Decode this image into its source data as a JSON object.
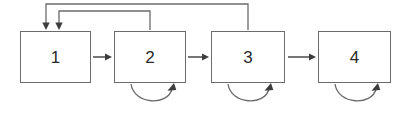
{
  "diagram": {
    "canvas": {
      "width": 410,
      "height": 115,
      "background": "#ffffff"
    },
    "style": {
      "stroke_color": "#6b6b6b",
      "arrow_color": "#3d3d3d",
      "text_color": "#2a2a2a",
      "box_fill": "#ffffff",
      "stroke_width": 1
    },
    "nodes": [
      {
        "id": "node-1",
        "label": "1",
        "x": 20,
        "y": 31,
        "width": 71,
        "height": 52
      },
      {
        "id": "node-2",
        "label": "2",
        "x": 114,
        "y": 31,
        "width": 72,
        "height": 52
      },
      {
        "id": "node-3",
        "label": "3",
        "x": 211,
        "y": 31,
        "width": 74,
        "height": 52
      },
      {
        "id": "node-4",
        "label": "4",
        "x": 318,
        "y": 31,
        "width": 73,
        "height": 52
      }
    ],
    "forward_arrows": [
      {
        "id": "arrow-1-to-2",
        "from": "node-1",
        "to": "node-2",
        "x1": 93,
        "x2": 112,
        "y": 57
      },
      {
        "id": "arrow-2-to-3",
        "from": "node-2",
        "to": "node-3",
        "x1": 188,
        "x2": 209,
        "y": 57
      },
      {
        "id": "arrow-3-to-4",
        "from": "node-3",
        "to": "node-4",
        "x1": 288,
        "x2": 316,
        "y": 57
      }
    ],
    "feedback_arrows": [
      {
        "id": "feedback-3-to-1",
        "from": "node-3",
        "to": "node-1",
        "source_x": 248,
        "rail_y": 4,
        "target_x": 46,
        "target_y": 30
      },
      {
        "id": "feedback-2-to-1",
        "from": "node-2",
        "to": "node-1",
        "source_x": 150,
        "rail_y": 11,
        "target_x": 59,
        "target_y": 30
      }
    ],
    "self_loops": [
      {
        "id": "self-loop-2",
        "node": "node-2",
        "start_x": 131,
        "end_x": 174,
        "top_y": 84,
        "depth": 20
      },
      {
        "id": "self-loop-3",
        "node": "node-3",
        "start_x": 228,
        "end_x": 271,
        "top_y": 84,
        "depth": 20
      },
      {
        "id": "self-loop-4",
        "node": "node-4",
        "start_x": 335,
        "end_x": 378,
        "top_y": 84,
        "depth": 20
      }
    ]
  }
}
